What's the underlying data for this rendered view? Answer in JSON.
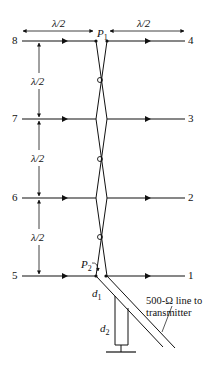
{
  "diagram": {
    "type": "antenna-array-schematic",
    "dimension_labels": {
      "top_left": "λ/2",
      "top_right": "λ/2",
      "vertical_1": "λ/2",
      "vertical_2": "λ/2",
      "vertical_3": "λ/2"
    },
    "points": {
      "p1": "P",
      "p1_sub": "1",
      "p2": "P",
      "p2_sub": "2"
    },
    "left_terminals": [
      "8",
      "7",
      "6",
      "5"
    ],
    "right_terminals": [
      "4",
      "3",
      "2",
      "1"
    ],
    "stub_labels": {
      "d1": "d",
      "d1_sub": "1",
      "d2": "d",
      "d2_sub": "2"
    },
    "feed_line_label": {
      "line1": "500-Ω line to",
      "line2": "transmitter"
    },
    "colors": {
      "ink": "#111111",
      "background": "#ffffff"
    }
  }
}
